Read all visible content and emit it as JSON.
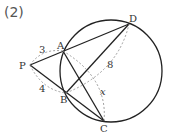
{
  "title": "(2)",
  "labels": {
    "P": "P",
    "A": "A",
    "B": "B",
    "C": "C",
    "D": "D"
  },
  "lengths": {
    "PA": "3",
    "PB": "4",
    "BD": "8",
    "AC": "x"
  }
}
